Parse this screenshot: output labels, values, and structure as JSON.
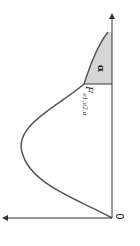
{
  "figure": {
    "origin_label": "0",
    "tail_area_label": "α",
    "critical_value_label": "F",
    "critical_value_subscript": "ν1,ν2,α",
    "curve_color": "#555555",
    "shade_color": "#d6d6d6",
    "axis_color": "#333333",
    "orientation": "rotated 90° clockwise"
  }
}
